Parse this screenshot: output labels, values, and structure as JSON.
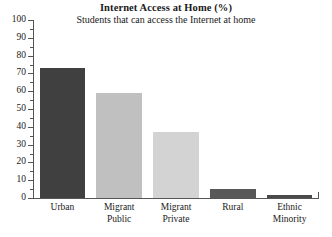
{
  "chart_data": {
    "type": "bar",
    "title": "Internet Access at Home (%)",
    "subtitle": "Students that can access the Internet at home",
    "xlabel": "",
    "ylabel": "",
    "ylim": [
      0,
      100
    ],
    "ytick_step": 10,
    "grid": false,
    "legend": "none",
    "orientation": "vertical",
    "categories": [
      "Urban",
      "Migrant Public",
      "Migrant Private",
      "Rural",
      "Ethnic Minority"
    ],
    "category_lines": [
      [
        "Urban",
        ""
      ],
      [
        "Migrant",
        "Public"
      ],
      [
        "Migrant",
        "Private"
      ],
      [
        "Rural",
        ""
      ],
      [
        "Ethnic",
        "Minority"
      ]
    ],
    "values": [
      73,
      59,
      37,
      5,
      1.5
    ],
    "bar_colors": [
      "#404040",
      "#c0c0c0",
      "#d3d3d3",
      "#585858",
      "#4a4a4a"
    ],
    "ytick_labels": [
      "0",
      "10",
      "20",
      "30",
      "40",
      "50",
      "60",
      "70",
      "80",
      "90",
      "100"
    ],
    "ytick_values": [
      0,
      10,
      20,
      30,
      40,
      50,
      60,
      70,
      80,
      90,
      100
    ],
    "axis_color": "#555555",
    "text_color": "#1a1a1a",
    "background": "#ffffff"
  }
}
